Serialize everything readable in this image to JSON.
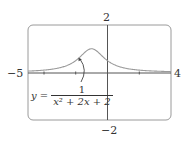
{
  "chart_data": {
    "type": "line",
    "title": "",
    "function_label": {
      "lhs": "y =",
      "numerator": "1",
      "denominator": "x² + 2x + 2"
    },
    "xlim": [
      -5,
      4
    ],
    "ylim": [
      -2,
      2
    ],
    "xlabel": "",
    "ylabel": "",
    "axis_labels": {
      "x_min": "−5",
      "x_max": "4",
      "y_max": "2",
      "y_min": "−2"
    },
    "x_ticks": [
      -4,
      -2,
      2
    ],
    "grid": false,
    "series": [
      {
        "name": "y = 1/(x^2 + 2x + 2)",
        "x": [
          -5,
          -4,
          -3,
          -2.5,
          -2,
          -1.5,
          -1,
          -0.5,
          0,
          0.5,
          1,
          2,
          3,
          4
        ],
        "values": [
          0.059,
          0.1,
          0.2,
          0.308,
          0.5,
          0.8,
          1.0,
          0.8,
          0.5,
          0.308,
          0.2,
          0.1,
          0.059,
          0.038
        ]
      }
    ],
    "colors": {
      "curve": "#999999",
      "frame": "#999999",
      "axes": "#666666"
    }
  }
}
